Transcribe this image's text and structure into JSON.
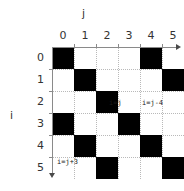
{
  "figure": {
    "title": "",
    "x_axis_caption": "j",
    "y_axis_caption": "i"
  },
  "axes": {
    "column_labels": [
      "0",
      "1",
      "2",
      "3",
      "4",
      "5"
    ],
    "row_labels": [
      "0",
      "1",
      "2",
      "3",
      "4",
      "5"
    ],
    "x_arrow_icon": "arrow-right-icon",
    "y_arrow_icon": "arrow-down-icon"
  },
  "annotations": [
    {
      "id": "main",
      "text": "i=j"
    },
    {
      "id": "upper",
      "text": "i=j-4"
    },
    {
      "id": "lower",
      "text": "i=j+3"
    }
  ],
  "colors": {
    "cell_fill": "#000000",
    "grid": "#b9b9b9",
    "axis": "#8a8a8a",
    "text": "#333333",
    "background": "#ffffff"
  },
  "chart_data": {
    "type": "heatmap",
    "title": "",
    "xlabel": "j",
    "ylabel": "i",
    "x": [
      0,
      1,
      2,
      3,
      4,
      5
    ],
    "y": [
      0,
      1,
      2,
      3,
      4,
      5
    ],
    "xlim": [
      0,
      6
    ],
    "ylim": [
      0,
      6
    ],
    "grid": true,
    "legend": "none",
    "cell_size_px": 22,
    "values": [
      [
        1,
        0,
        0,
        0,
        1,
        0
      ],
      [
        0,
        1,
        0,
        0,
        0,
        1
      ],
      [
        0,
        0,
        1,
        0,
        0,
        0
      ],
      [
        1,
        0,
        0,
        1,
        0,
        0
      ],
      [
        0,
        1,
        0,
        0,
        1,
        0
      ],
      [
        0,
        0,
        1,
        0,
        0,
        1
      ]
    ],
    "filled_cells": [
      {
        "i": 0,
        "j": 0
      },
      {
        "i": 0,
        "j": 4
      },
      {
        "i": 1,
        "j": 1
      },
      {
        "i": 1,
        "j": 5
      },
      {
        "i": 2,
        "j": 2
      },
      {
        "i": 3,
        "j": 0
      },
      {
        "i": 3,
        "j": 3
      },
      {
        "i": 4,
        "j": 1
      },
      {
        "i": 4,
        "j": 4
      },
      {
        "i": 5,
        "j": 2
      },
      {
        "i": 5,
        "j": 5
      }
    ],
    "diagonals": [
      {
        "label": "i=j",
        "offset": 0
      },
      {
        "label": "i=j-4",
        "offset": -4
      },
      {
        "label": "i=j+3",
        "offset": 3
      }
    ]
  }
}
